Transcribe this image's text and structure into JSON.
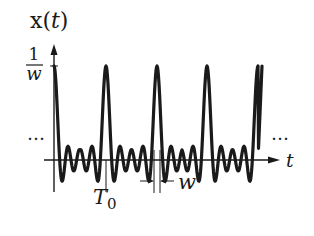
{
  "diagram": {
    "type": "periodic-signal-plot",
    "y_axis_label": "x(t)",
    "y_axis_label_var": "t",
    "y_axis_label_fn": "x",
    "peak_value_numerator": "1",
    "peak_value_denominator": "w",
    "x_axis_label": "t",
    "period_label": "T",
    "period_subscript": "0",
    "pulse_width_label": "w",
    "continuation_left": "…",
    "continuation_right": "…",
    "colors": {
      "stroke": "#1a1a1a",
      "background": "#ffffff"
    }
  }
}
